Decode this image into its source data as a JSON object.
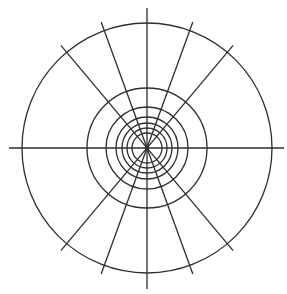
{
  "diagram": {
    "type": "polar-grid",
    "background": "#ffffff",
    "stroke_color": "#2e2e2e",
    "stroke_width": 1.3,
    "center": {
      "x": 147,
      "y": 148
    },
    "circle_radii": [
      125,
      60,
      41,
      31,
      25,
      20,
      15
    ],
    "radial_line_half_length": 134,
    "radial_angles_deg": [
      0,
      90,
      110,
      130,
      70,
      50
    ],
    "axis_extents": {
      "horizontal": {
        "x1": 9,
        "x2": 284
      },
      "vertical": {
        "y1": 8,
        "y2": 289
      }
    }
  }
}
